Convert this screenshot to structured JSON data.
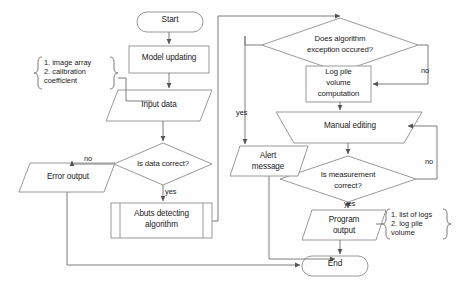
{
  "diagram": {
    "stroke_color": "#8a8a8a",
    "text_color": "#1a1a1a",
    "fill_color": "#ffffff",
    "nodes": {
      "start": {
        "label": "Start",
        "shape": "terminator"
      },
      "model_updating": {
        "label": "Model updating",
        "shape": "process"
      },
      "input_data": {
        "label": "Input data",
        "shape": "data"
      },
      "is_data_correct": {
        "label": "Is data correct?",
        "shape": "decision"
      },
      "error_output": {
        "label": "Error output",
        "shape": "data"
      },
      "abuts_detecting": {
        "label_line1": "Abuts detecting",
        "label_line2": "algorithm",
        "shape": "predefined-process"
      },
      "exception_decision": {
        "label_line1": "Does algorithm",
        "label_line2": "exception occured?",
        "shape": "decision"
      },
      "log_pile_volume": {
        "label_line1": "Log pile",
        "label_line2": "volume",
        "label_line3": "computation",
        "shape": "process"
      },
      "manual_editing": {
        "label": "Manual editing",
        "shape": "manual-operation"
      },
      "is_measurement_correct": {
        "label_line1": "Is measurement",
        "label_line2": "correct?",
        "shape": "decision"
      },
      "alert_message": {
        "label_line1": "Alert",
        "label_line2": "message",
        "shape": "data"
      },
      "program_output": {
        "label_line1": "Program",
        "label_line2": "output",
        "shape": "data"
      },
      "end": {
        "label": "End",
        "shape": "terminator"
      }
    },
    "annotations": {
      "input_note": {
        "line1": "1. image array",
        "line2": "2. calibration",
        "line3": "coefficient"
      },
      "output_note": {
        "line1": "1. list of logs",
        "line2": "2. log pile",
        "line3": "volume"
      }
    },
    "edge_labels": {
      "data_correct_no": "no",
      "data_correct_yes": "yes",
      "exception_yes": "yes",
      "exception_no": "no",
      "measurement_no": "no",
      "measurement_yes": "yes"
    }
  }
}
